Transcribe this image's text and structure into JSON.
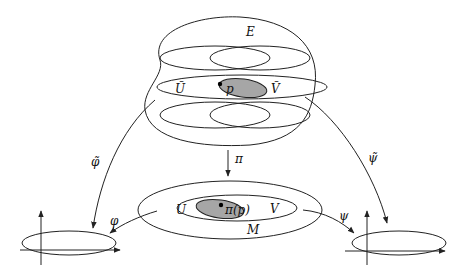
{
  "diagram": {
    "type": "fiber-bundle-local-trivialization",
    "labels": {
      "total_space": "E",
      "open_set_tilde_U": "Ũ",
      "open_set_tilde_V": "Ṽ",
      "point": "p",
      "projection": "π",
      "base_space": "M",
      "open_set_U": "U",
      "open_set_V": "V",
      "projected_point": "π(p)",
      "chart_phi": "φ",
      "chart_psi": "ψ",
      "lifted_chart_phi": "φ̃",
      "lifted_chart_psi": "ψ̃"
    },
    "colors": {
      "line": "#222222",
      "highlight_fill": "#a6a6a6",
      "background": "#ffffff"
    }
  }
}
